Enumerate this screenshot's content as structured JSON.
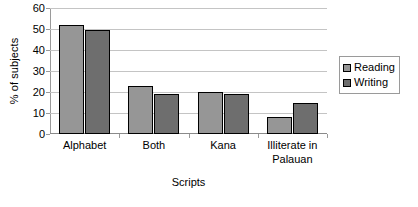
{
  "chart_data": {
    "type": "bar",
    "title": "",
    "xlabel": "Scripts",
    "ylabel": "% of subjects",
    "categories": [
      "Alphabet",
      "Both",
      "Kana",
      "Illiterate in Palauan"
    ],
    "category_lines": [
      [
        "Alphabet"
      ],
      [
        "Both"
      ],
      [
        "Kana"
      ],
      [
        "Illiterate in",
        "Palauan"
      ]
    ],
    "series": [
      {
        "name": "Reading",
        "color": "#969696",
        "values": [
          52,
          23,
          20,
          8
        ]
      },
      {
        "name": "Writing",
        "color": "#6e6e6e",
        "values": [
          49.5,
          19,
          19,
          15
        ]
      }
    ],
    "ylim": [
      0,
      60
    ],
    "yticks": [
      0,
      10,
      20,
      30,
      40,
      50,
      60
    ],
    "ytick_labels": [
      "0",
      "10",
      "20",
      "30",
      "40",
      "50",
      "60"
    ],
    "grid": true,
    "legend_position": "right"
  },
  "legend": {
    "entries": [
      {
        "label": "Reading",
        "swatch": "reading-swatch"
      },
      {
        "label": "Writing",
        "swatch": "writing-swatch"
      }
    ]
  },
  "colors": {
    "reading": "#969696",
    "writing": "#6e6e6e",
    "gridline": "#c4c4c4",
    "axis": "#9a9a9a",
    "bar_outline": "#000000",
    "background": "#ffffff"
  }
}
